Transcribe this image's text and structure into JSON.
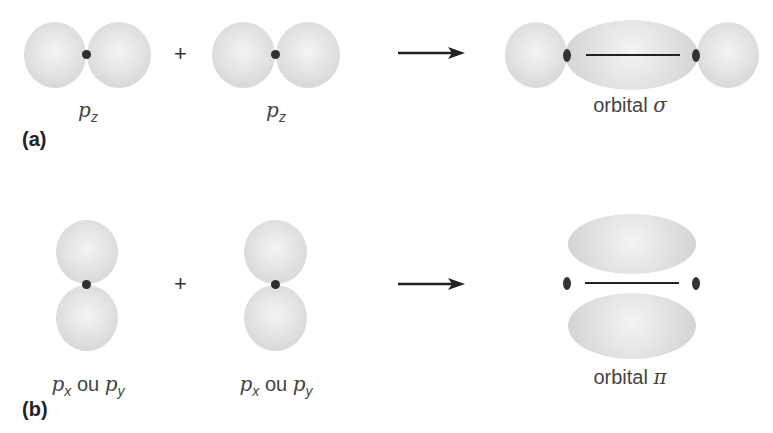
{
  "panels": [
    {
      "id": "a",
      "label": "(a)",
      "operands": [
        {
          "symbol": "p",
          "subscript": "z"
        },
        {
          "symbol": "p",
          "subscript": "z"
        }
      ],
      "operator": "+",
      "result": {
        "word": "orbital",
        "symbol": "σ"
      }
    },
    {
      "id": "b",
      "label": "(b)",
      "operands": [
        {
          "symbol": "p",
          "subscript": "x",
          "joiner": "ou",
          "symbol2": "p",
          "subscript2": "y"
        },
        {
          "symbol": "p",
          "subscript": "x",
          "joiner": "ou",
          "symbol2": "p",
          "subscript2": "y"
        }
      ],
      "operator": "+",
      "result": {
        "word": "orbital",
        "symbol": "π"
      }
    }
  ],
  "colors": {
    "lobe": "#dcdcdc",
    "nucleus": "#2f2f2f",
    "text": "#444444"
  }
}
